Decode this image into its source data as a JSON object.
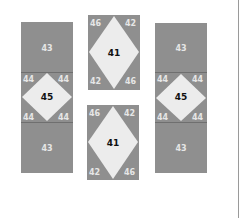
{
  "colors": {
    "patch_dark": "#8f8f8f",
    "patch_light": "#ececec",
    "label_light": "#e6e6e6",
    "label_dark": "#111111"
  },
  "left_column": {
    "top": "43",
    "center": "45",
    "corners": [
      "44",
      "44",
      "44",
      "44"
    ],
    "bottom": "43"
  },
  "middle_top": {
    "center": "41",
    "tl": "46",
    "tr": "42",
    "bl": "42",
    "br": "46"
  },
  "middle_bottom": {
    "center": "41",
    "tl": "46",
    "tr": "42",
    "bl": "42",
    "br": "46"
  },
  "right_column": {
    "top": "43",
    "center": "45",
    "corners": [
      "44",
      "44",
      "44",
      "44"
    ],
    "bottom": "43"
  }
}
